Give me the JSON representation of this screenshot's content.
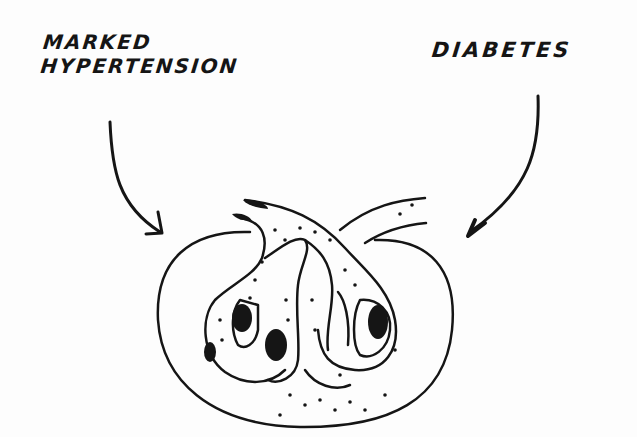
{
  "labels": {
    "left_line1": "MARKED",
    "left_line2": "HYPERTENSION",
    "right": "DIABETES"
  },
  "colors": {
    "ink": "#151515",
    "paper": "#fdfdfd"
  }
}
